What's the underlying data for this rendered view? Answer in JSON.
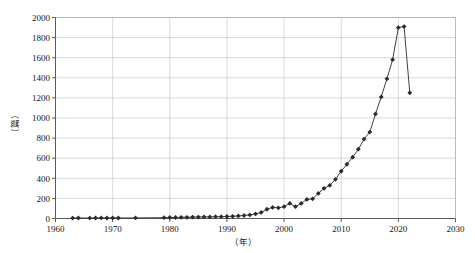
{
  "chart_data": {
    "type": "line",
    "title": "",
    "subtitle": "",
    "xlabel": "（年）",
    "ylabel": "（篇）",
    "xlim": [
      1960,
      2030
    ],
    "ylim": [
      0,
      2000
    ],
    "xticks": [
      1960,
      1970,
      1980,
      1990,
      2000,
      2010,
      2020,
      2030
    ],
    "xtick_labels": [
      "1960",
      "1970",
      "1980",
      "1990",
      "2000",
      "2010",
      "2020",
      "2030"
    ],
    "yticks": [
      0,
      200,
      400,
      600,
      800,
      1000,
      1200,
      1400,
      1600,
      1800,
      2000
    ],
    "ytick_labels": [
      "0",
      "200",
      "400",
      "600",
      "800",
      "1000",
      "1200",
      "1400",
      "1600",
      "1800",
      "2000"
    ],
    "grid": true,
    "grid_color": "#c9c9c9",
    "legend": null,
    "legend_position": "none",
    "marker": "filled-diamond",
    "line_color": "#2b2b2b",
    "marker_color": "#2b2b2b",
    "series": [
      {
        "name": "年度发文量",
        "x": [
          1963,
          1964,
          1966,
          1967,
          1968,
          1969,
          1970,
          1971,
          1974,
          1979,
          1980,
          1981,
          1982,
          1983,
          1984,
          1985,
          1986,
          1987,
          1988,
          1989,
          1990,
          1991,
          1992,
          1993,
          1994,
          1995,
          1996,
          1997,
          1998,
          1999,
          2000,
          2001,
          2002,
          2003,
          2004,
          2005,
          2006,
          2007,
          2008,
          2009,
          2010,
          2011,
          2012,
          2013,
          2014,
          2015,
          2016,
          2017,
          2018,
          2019,
          2020,
          2021,
          2022
        ],
        "values": [
          4,
          5,
          4,
          5,
          6,
          5,
          6,
          5,
          6,
          8,
          10,
          10,
          12,
          12,
          14,
          14,
          16,
          16,
          18,
          18,
          20,
          22,
          26,
          30,
          36,
          46,
          60,
          92,
          110,
          106,
          118,
          150,
          118,
          150,
          190,
          196,
          250,
          300,
          330,
          390,
          470,
          540,
          610,
          690,
          790,
          860,
          1040,
          1210,
          1390,
          1580,
          1900,
          1910,
          1250
        ]
      }
    ]
  },
  "axis": {
    "y_unit_label": "（篇）",
    "x_unit_label": "（年）"
  },
  "watermark": {
    "text": ""
  }
}
